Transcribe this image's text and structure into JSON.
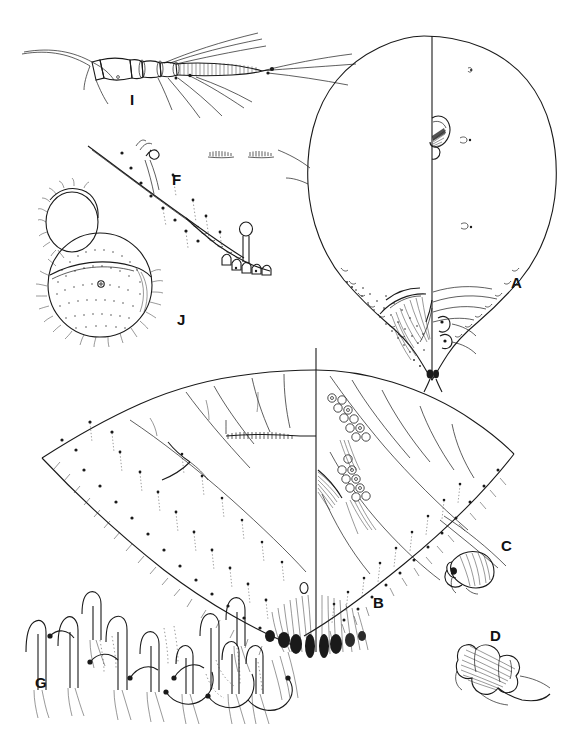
{
  "plate": {
    "kind": "scientific-illustration-plate",
    "subject": "whitefly puparium morphology plate",
    "background_color": "#ffffff",
    "ink_color": "#1a1a1a",
    "width": 581,
    "height": 746
  },
  "panels": [
    {
      "id": "I",
      "label": "I",
      "name": "antenna-segments",
      "description": "antenna / leg with annulated segments and long setae",
      "label_x": 135,
      "label_y": 100
    },
    {
      "id": "F",
      "label": "F",
      "name": "margin-setae-detail",
      "description": "body margin with crenulations, peg setae and a stalked pore",
      "label_x": 178,
      "label_y": 180
    },
    {
      "id": "J",
      "label": "J",
      "name": "stippled-opercula",
      "description": "two stippled rounded structures, operculum and lingula",
      "label_x": 182,
      "label_y": 320
    },
    {
      "id": "A",
      "label": "A",
      "name": "puparium-dorsal-outline",
      "description": "large ovoid puparium, left half plain and right half with detail, vertical midline",
      "label_x": 516,
      "label_y": 283
    },
    {
      "id": "B",
      "label": "B",
      "name": "abdominal-segment-outline",
      "description": "large V shaped abdominal outline with marginal setae and pore clusters",
      "label_x": 378,
      "label_y": 603
    },
    {
      "id": "C",
      "label": "C",
      "name": "cephalic-appendage-detail",
      "description": "small flared appendage with basal seta",
      "label_x": 505,
      "label_y": 546
    },
    {
      "id": "D",
      "label": "D",
      "name": "striated-appendage-detail",
      "description": "small striated lobed structure",
      "label_x": 494,
      "label_y": 636
    },
    {
      "id": "G",
      "label": "G",
      "name": "hooked-setae-row",
      "description": "row of hooked and looped marginal setae",
      "label_x": 40,
      "label_y": 683
    }
  ]
}
